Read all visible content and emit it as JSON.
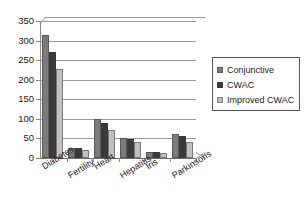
{
  "chart_data": {
    "type": "bar",
    "title": "",
    "xlabel": "",
    "ylabel": "",
    "ylim": [
      0,
      350
    ],
    "yticks": [
      0,
      50,
      100,
      150,
      200,
      250,
      300,
      350
    ],
    "grid": true,
    "legend_position": "right",
    "categories": [
      "Diabetes",
      "Fertility",
      "Heart",
      "Hepatitis",
      "Iris",
      "Parkinsons"
    ],
    "series": [
      {
        "name": "Conjunctive",
        "color": "#7b7b7b",
        "values": [
          313,
          25,
          100,
          51,
          16,
          62
        ]
      },
      {
        "name": "CWAC",
        "color": "#3a3a3a",
        "values": [
          272,
          25,
          90,
          49,
          16,
          57
        ]
      },
      {
        "name": "Improved CWAC",
        "color": "#c0c0c0",
        "values": [
          228,
          21,
          72,
          40,
          14,
          40
        ]
      }
    ]
  }
}
